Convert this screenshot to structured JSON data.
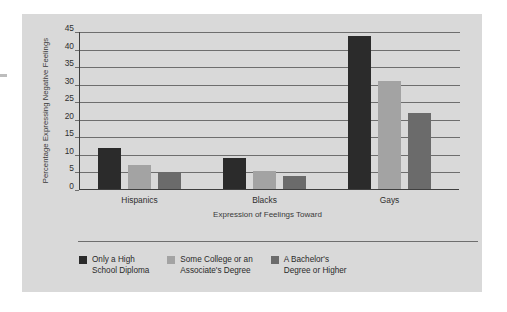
{
  "chart_data": {
    "type": "bar",
    "title": "",
    "subtitle": "",
    "xlabel": "Expression of Feelings Toward",
    "ylabel": "Percentage Expressing Negative Feelings",
    "categories": [
      "Hispanics",
      "Blacks",
      "Gays"
    ],
    "series": [
      {
        "name": "Only a High\nSchool Diploma",
        "color": "#2b2b2b",
        "values": [
          12,
          9,
          44
        ]
      },
      {
        "name": "Some College or an\nAssociate's Degree",
        "color": "#a3a3a3",
        "values": [
          7,
          5.5,
          31
        ]
      },
      {
        "name": "A Bachelor's\nDegree or Higher",
        "color": "#6b6b6b",
        "values": [
          5,
          4,
          22
        ]
      }
    ],
    "ylim": [
      0,
      45
    ],
    "ytick_labels": [
      "0",
      "5",
      "10",
      "15",
      "20",
      "25",
      "30",
      "35",
      "40",
      "45"
    ],
    "ytick_values": [
      0,
      5,
      10,
      15,
      20,
      25,
      30,
      35,
      40,
      45
    ],
    "grid": true,
    "legend_position": "bottom",
    "panel_background": "#d9d9d9",
    "gridline_color": "#6e6e6e",
    "axis_color": "#3f3f3f"
  }
}
